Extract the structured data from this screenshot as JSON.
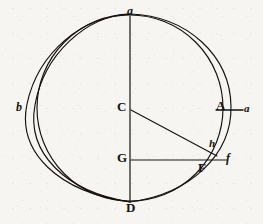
{
  "figure": {
    "canvas": {
      "width": 263,
      "height": 224
    },
    "background_color": "#f6f5f2",
    "ink_color": "#15120f",
    "stroke_width": 1.1,
    "points": {
      "a": {
        "label": "a",
        "x": 130,
        "y": 14,
        "style": "italic-lower",
        "role": "top-intersection"
      },
      "D": {
        "label": "D",
        "x": 131,
        "y": 205,
        "style": "capital",
        "role": "bottom-intersection"
      },
      "C": {
        "label": "C",
        "x": 122,
        "y": 106,
        "style": "capital",
        "role": "center-inner-circle"
      },
      "G": {
        "label": "G",
        "x": 122,
        "y": 157,
        "style": "capital",
        "role": "lower-center"
      },
      "A": {
        "label": "A",
        "x": 223,
        "y": 107,
        "style": "capital",
        "role": "inner-circle-right"
      },
      "a2": {
        "label": "a",
        "x": 245,
        "y": 109,
        "style": "italic-lower",
        "role": "outer-arc-right"
      },
      "b": {
        "label": "b",
        "x": 20,
        "y": 108,
        "style": "italic-lower",
        "role": "outer-arc-left"
      },
      "h": {
        "label": "h",
        "x": 211,
        "y": 145,
        "style": "italic-lower",
        "role": "diagonal-arc-crossing"
      },
      "F": {
        "label": "F",
        "x": 203,
        "y": 167,
        "style": "capital",
        "role": "inner-circle-lower-right"
      },
      "f": {
        "label": "f",
        "x": 228,
        "y": 162,
        "style": "italic-lower",
        "role": "outer-arc-lower-right"
      }
    },
    "circles": [
      {
        "name": "inner-circle",
        "cx": 130,
        "cy": 108,
        "r": 93,
        "description": "main circle centred at C passing through a, A, D"
      },
      {
        "name": "outer-circle",
        "cx": 122,
        "cy": 108,
        "rx": 101,
        "ry": 96,
        "description": "second circle shifted left, passing through a, b, D, a-right"
      },
      {
        "name": "offset-arc",
        "cx": 118,
        "cy": 108,
        "rx": 105,
        "ry": 95,
        "description": "outermost left arc through b"
      }
    ],
    "lines": [
      {
        "name": "vertical-diameter",
        "from": "a",
        "to": "D",
        "x1": 130,
        "y1": 16,
        "x2": 130,
        "y2": 202
      },
      {
        "name": "radius-C-to-h",
        "from": "C",
        "to": "h",
        "x1": 131,
        "y1": 110,
        "x2": 216,
        "y2": 155
      },
      {
        "name": "horizontal-G-to-f",
        "from": "G",
        "to": "f",
        "x1": 131,
        "y1": 160,
        "x2": 226,
        "y2": 160
      },
      {
        "name": "horizontal-A-to-a",
        "from": "A",
        "to": "a2",
        "x1": 216,
        "y1": 110,
        "x2": 244,
        "y2": 110
      }
    ]
  }
}
